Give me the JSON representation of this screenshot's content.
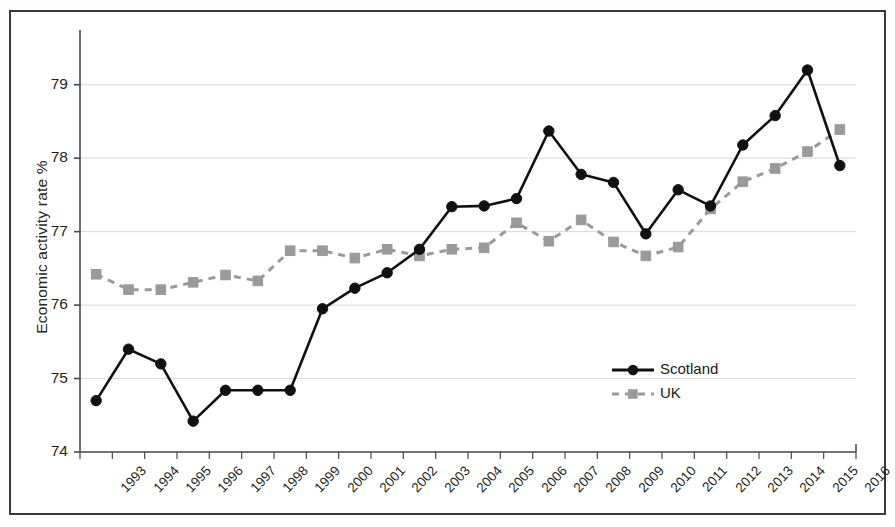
{
  "chart_data": {
    "type": "line",
    "title": "",
    "xlabel": "",
    "ylabel": "Economic activity rate %",
    "ylim": [
      74,
      79.5
    ],
    "yticks": [
      74,
      75,
      76,
      77,
      78,
      79
    ],
    "grid": true,
    "legend_position": "center-right",
    "categories": [
      "1993",
      "1994",
      "1995",
      "1996",
      "1997",
      "1998",
      "1999",
      "2000",
      "2001",
      "2002",
      "2003",
      "2004",
      "2005",
      "2006",
      "2007",
      "2008",
      "2009",
      "2010",
      "2011",
      "2012",
      "2013",
      "2014",
      "2015",
      "2016"
    ],
    "series": [
      {
        "name": "Scotland",
        "color": "#111111",
        "marker": "circle",
        "linestyle": "solid",
        "values": [
          74.7,
          75.4,
          75.2,
          74.42,
          74.84,
          74.84,
          74.84,
          75.95,
          76.23,
          76.44,
          76.76,
          77.34,
          77.35,
          77.45,
          78.37,
          77.78,
          77.67,
          76.97,
          77.57,
          77.35,
          78.18,
          78.58,
          79.2,
          77.9
        ]
      },
      {
        "name": "UK",
        "color": "#9a9a9a",
        "marker": "square",
        "linestyle": "dashed",
        "values": [
          76.42,
          76.21,
          76.21,
          76.31,
          76.41,
          76.33,
          76.74,
          76.74,
          76.64,
          76.76,
          76.67,
          76.76,
          76.78,
          77.12,
          76.87,
          77.16,
          76.86,
          76.67,
          76.79,
          77.31,
          77.68,
          77.86,
          78.09,
          78.39
        ]
      }
    ]
  },
  "legend": {
    "entries": [
      {
        "label": "Scotland"
      },
      {
        "label": "UK"
      }
    ]
  },
  "axes": {
    "y_label": "Economic activity rate %"
  }
}
